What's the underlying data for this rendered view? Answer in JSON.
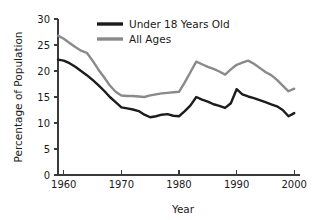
{
  "chart_data": {
    "type": "line",
    "title": "",
    "xlabel": "Year",
    "ylabel": "Percentage of Population",
    "xlim": [
      1959,
      2001
    ],
    "ylim": [
      0,
      30
    ],
    "yticks": [
      0,
      5,
      10,
      15,
      20,
      25,
      30
    ],
    "ytick_labels": [
      "0",
      "5",
      "10",
      "15",
      "20",
      "25",
      "30"
    ],
    "xticks": [
      1960,
      1970,
      1980,
      1990,
      2000
    ],
    "xtick_labels": [
      "1960",
      "1970",
      "1980",
      "1990",
      "2000"
    ],
    "grid": false,
    "legend_position": "top-center",
    "series": [
      {
        "name": "Under 18 Years Old",
        "color": "#1c1c1c",
        "x": [
          1959,
          1960,
          1961,
          1962,
          1963,
          1964,
          1965,
          1966,
          1967,
          1968,
          1969,
          1970,
          1971,
          1972,
          1973,
          1974,
          1975,
          1976,
          1977,
          1978,
          1979,
          1980,
          1981,
          1982,
          1983,
          1984,
          1985,
          1986,
          1987,
          1988,
          1989,
          1990,
          1991,
          1992,
          1993,
          1994,
          1995,
          1996,
          1997,
          1998,
          1999,
          2000
        ],
        "values": [
          22.2,
          22.0,
          21.5,
          20.8,
          20.0,
          19.2,
          18.3,
          17.3,
          16.2,
          15.0,
          14.0,
          13.0,
          12.8,
          12.6,
          12.3,
          11.6,
          11.1,
          11.3,
          11.6,
          11.7,
          11.4,
          11.3,
          12.3,
          13.4,
          15.0,
          14.5,
          14.1,
          13.6,
          13.3,
          12.9,
          13.8,
          16.5,
          15.5,
          15.1,
          14.8,
          14.4,
          14.0,
          13.6,
          13.2,
          12.5,
          11.3,
          11.9
        ]
      },
      {
        "name": "All Ages",
        "color": "#8a8a8a",
        "x": [
          1959,
          1960,
          1961,
          1962,
          1963,
          1964,
          1965,
          1966,
          1967,
          1968,
          1969,
          1970,
          1971,
          1972,
          1973,
          1974,
          1975,
          1976,
          1977,
          1978,
          1979,
          1980,
          1981,
          1982,
          1983,
          1984,
          1985,
          1986,
          1987,
          1988,
          1989,
          1990,
          1991,
          1992,
          1993,
          1994,
          1995,
          1996,
          1997,
          1998,
          1999,
          2000
        ],
        "values": [
          26.8,
          26.2,
          25.4,
          24.6,
          23.9,
          23.5,
          22.0,
          20.3,
          18.8,
          17.2,
          16.0,
          15.3,
          15.2,
          15.2,
          15.1,
          15.0,
          15.3,
          15.5,
          15.7,
          15.8,
          15.9,
          16.0,
          17.8,
          19.8,
          21.8,
          21.3,
          20.8,
          20.4,
          19.9,
          19.3,
          20.3,
          21.2,
          21.6,
          22.0,
          21.4,
          20.6,
          19.8,
          19.2,
          18.3,
          17.2,
          16.1,
          16.6
        ]
      }
    ]
  },
  "legend": {
    "items": [
      {
        "label": "Under 18 Years Old"
      },
      {
        "label": "All Ages"
      }
    ]
  },
  "axes": {
    "x_title": "Year",
    "y_title": "Percentage of Population"
  }
}
